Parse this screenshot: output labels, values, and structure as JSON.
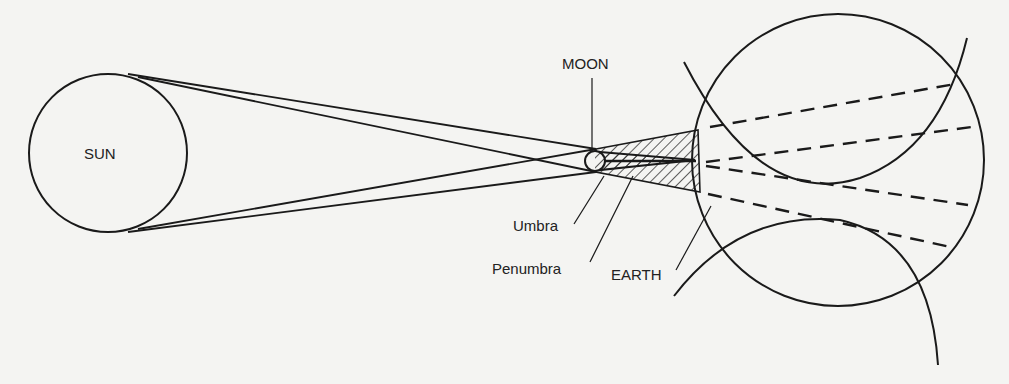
{
  "labels": {
    "sun": "SUN",
    "moon": "MOON",
    "umbra": "Umbra",
    "penumbra": "Penumbra",
    "earth": "EARTH"
  },
  "colors": {
    "background": "#f4f4f2",
    "ink": "#1a1a1a"
  }
}
